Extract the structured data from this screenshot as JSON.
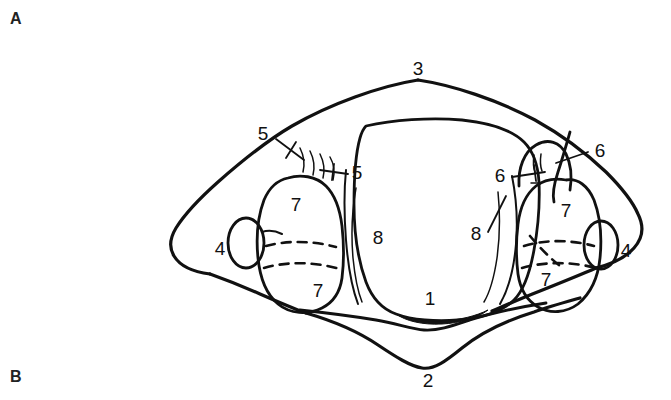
{
  "figure": {
    "panels": [
      {
        "id": "A",
        "label": "A",
        "position": "top-left"
      },
      {
        "id": "B",
        "label": "B",
        "position": "bottom-left"
      }
    ],
    "ink_color": "#111111",
    "background_color": "#ffffff",
    "labels": [
      {
        "id": "label-3-anterior-arch",
        "text": "3",
        "x": 418,
        "y": 70
      },
      {
        "id": "label-5-outer-left",
        "text": "5",
        "x": 263,
        "y": 135
      },
      {
        "id": "label-5-inner-left",
        "text": "5",
        "x": 357,
        "y": 174
      },
      {
        "id": "label-6-inner-right",
        "text": "6",
        "x": 500,
        "y": 177
      },
      {
        "id": "label-6-outer-right",
        "text": "6",
        "x": 600,
        "y": 152
      },
      {
        "id": "label-7-left-superior-facet",
        "text": "7",
        "x": 296,
        "y": 206
      },
      {
        "id": "label-7-left-inferior-facet",
        "text": "7",
        "x": 318,
        "y": 292
      },
      {
        "id": "label-7-right-superior-facet",
        "text": "7",
        "x": 566,
        "y": 212
      },
      {
        "id": "label-7-right-inferior-facet",
        "text": "7",
        "x": 546,
        "y": 281
      },
      {
        "id": "label-8-left",
        "text": "8",
        "x": 378,
        "y": 239
      },
      {
        "id": "label-8-right",
        "text": "8",
        "x": 476,
        "y": 235
      },
      {
        "id": "label-4-left-transverse-foramen",
        "text": "4",
        "x": 220,
        "y": 250
      },
      {
        "id": "label-4-right-transverse-foramen",
        "text": "4",
        "x": 626,
        "y": 252
      },
      {
        "id": "label-1-posterior-tubercle",
        "text": "1",
        "x": 430,
        "y": 300
      },
      {
        "id": "label-2-spinous-process",
        "text": "2",
        "x": 428,
        "y": 382
      }
    ]
  }
}
